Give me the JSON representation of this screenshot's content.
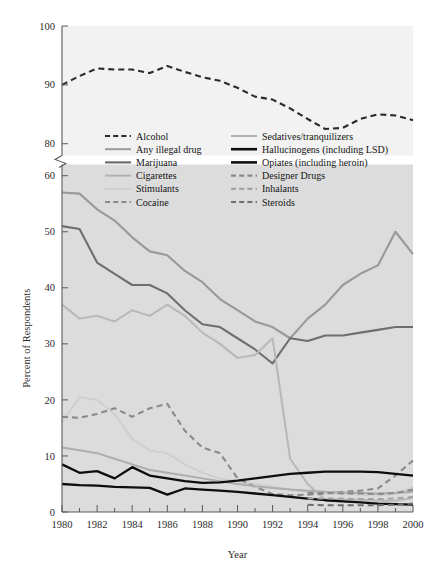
{
  "chart_data": {
    "type": "line",
    "title": "",
    "xlabel": "Year",
    "ylabel": "Percent of Respondents",
    "x": [
      1980,
      1981,
      1982,
      1983,
      1984,
      1985,
      1986,
      1987,
      1988,
      1989,
      1990,
      1991,
      1992,
      1993,
      1994,
      1995,
      1996,
      1997,
      1998,
      1999,
      2000
    ],
    "xlim": [
      1980,
      2000
    ],
    "xticks": [
      "1980",
      "1982",
      "1984",
      "1986",
      "1988",
      "1990",
      "1992",
      "1994",
      "1996",
      "1998",
      "2000"
    ],
    "yticks_lower": [
      "0",
      "10",
      "20",
      "30",
      "40",
      "50",
      "60"
    ],
    "yticks_upper": [
      "80",
      "90",
      "100"
    ],
    "ylim_lower": [
      0,
      62
    ],
    "ylim_upper": [
      78,
      100
    ],
    "axis_break": true,
    "grid": false,
    "legend_position": "inside-top",
    "series": [
      {
        "name": "Alcohol",
        "style": "dashed",
        "color": "#2b2b2b",
        "width": 2.1,
        "values": [
          90,
          91.5,
          92.8,
          92.6,
          92.6,
          92,
          93.2,
          92.2,
          91.3,
          90.7,
          89.5,
          88,
          87.5,
          86,
          84.2,
          82.5,
          82.7,
          84.2,
          85,
          84.8,
          84
        ]
      },
      {
        "name": "Any illegal drug",
        "style": "solid",
        "color": "#999999",
        "width": 2.1,
        "values": [
          57,
          56.8,
          54,
          52,
          49,
          46.5,
          45.8,
          43,
          41,
          38,
          36,
          34,
          33,
          31,
          34.5,
          37,
          40.5,
          42.5,
          44,
          50,
          46
        ]
      },
      {
        "name": "Marijuana",
        "style": "solid",
        "color": "#6e6e6e",
        "width": 2.1,
        "values": [
          51,
          50.5,
          44.5,
          42.5,
          40.5,
          40.5,
          39,
          36,
          33.5,
          33,
          31,
          29,
          26.5,
          31,
          30.5,
          31.5,
          31.5,
          32,
          32.5,
          33,
          33
        ]
      },
      {
        "name": "Cigarettes",
        "style": "solid",
        "color": "#b8b8b8",
        "width": 2.0,
        "values": [
          37,
          34.5,
          35,
          34,
          36,
          35,
          37,
          35,
          32,
          30,
          27.5,
          28,
          31,
          9.5,
          5,
          2.2,
          2.2,
          2.2,
          2,
          2,
          2.5
        ]
      },
      {
        "name": "Stimulants",
        "style": "solid",
        "color": "#cfcfcf",
        "width": 2.0,
        "values": [
          16,
          20.5,
          20,
          17.5,
          13,
          11,
          10.5,
          8.5,
          7,
          6,
          5.5,
          5,
          4.5,
          4,
          3.6,
          3.3,
          3.2,
          3.1,
          3,
          3.2,
          4.5
        ]
      },
      {
        "name": "Cocaine",
        "style": "dashed",
        "color": "#8a8a8a",
        "width": 2.1,
        "values": [
          17,
          16.8,
          17.5,
          18.5,
          17,
          18.5,
          19.3,
          14.5,
          11.5,
          10.5,
          6,
          4.5,
          3.2,
          3,
          3.1,
          3.3,
          3.6,
          3.8,
          4.2,
          6.5,
          9.2
        ]
      },
      {
        "name": "Sedatives/tranquilizers",
        "style": "solid",
        "color": "#adadad",
        "width": 2.0,
        "values": [
          11.5,
          11,
          10.5,
          9.5,
          8.5,
          7.5,
          7,
          6.5,
          6,
          5.5,
          5,
          4.6,
          4.3,
          4,
          3.8,
          3.6,
          3.5,
          3.4,
          3.3,
          3.4,
          3.6
        ]
      },
      {
        "name": "Hallucinogens (including LSD)",
        "style": "solid",
        "color": "#0d0d0d",
        "width": 2.3,
        "values": [
          8.5,
          7,
          7.3,
          6,
          8,
          6.5,
          6,
          5.5,
          5.2,
          5.3,
          5.6,
          6,
          6.4,
          6.8,
          7,
          7.2,
          7.2,
          7.2,
          7.1,
          6.8,
          6.5
        ]
      },
      {
        "name": "Opiates (including heroin)",
        "style": "solid",
        "color": "#0d0d0d",
        "width": 2.3,
        "values": [
          5,
          4.8,
          4.7,
          4.5,
          4.4,
          4.3,
          3.1,
          4.2,
          4,
          3.8,
          3.6,
          3.3,
          3,
          2.7,
          2.4,
          2.1,
          1.9,
          1.7,
          1.5,
          1.4,
          1.3
        ]
      },
      {
        "name": "Designer Drugs",
        "style": "dashed",
        "color": "#8a8a8a",
        "width": 2.0,
        "values": [
          null,
          null,
          null,
          null,
          null,
          null,
          null,
          null,
          null,
          null,
          null,
          null,
          null,
          null,
          3.4,
          3.4,
          3.3,
          3.3,
          3.2,
          3.4,
          4.0
        ]
      },
      {
        "name": "Inhalants",
        "style": "dashed",
        "color": "#a5a5a5",
        "width": 2.0,
        "values": [
          null,
          null,
          null,
          null,
          null,
          null,
          null,
          null,
          null,
          null,
          null,
          null,
          null,
          null,
          2.4,
          2.4,
          2.4,
          2.3,
          2.3,
          2.4,
          2.7
        ]
      },
      {
        "name": "Steroids",
        "style": "dashed",
        "color": "#6e6e6e",
        "width": 2.0,
        "values": [
          null,
          null,
          null,
          null,
          null,
          null,
          null,
          null,
          null,
          null,
          null,
          null,
          null,
          null,
          1.3,
          1.2,
          1.2,
          1.2,
          1.2,
          1.3,
          1.5
        ]
      }
    ]
  },
  "legend": {
    "col1": [
      {
        "label": "Alcohol",
        "style": "dashed",
        "color": "#2b2b2b",
        "width": 2.2
      },
      {
        "label": "Any illegal drug",
        "style": "solid",
        "color": "#999999",
        "width": 2.0
      },
      {
        "label": "Marijuana",
        "style": "solid",
        "color": "#6e6e6e",
        "width": 2.2
      },
      {
        "label": "Cigarettes",
        "style": "solid",
        "color": "#b0b0b0",
        "width": 2.0
      },
      {
        "label": "Stimulants",
        "style": "solid",
        "color": "#cfcfcf",
        "width": 2.0
      },
      {
        "label": "Cocaine",
        "style": "dashed",
        "color": "#8a8a8a",
        "width": 2.2
      }
    ],
    "col2": [
      {
        "label": "Sedatives/tranquilizers",
        "style": "solid",
        "color": "#b0b0b0",
        "width": 2.0
      },
      {
        "label": "Hallucinogens (including LSD)",
        "style": "solid",
        "color": "#0d0d0d",
        "width": 2.6
      },
      {
        "label": "Opiates (including heroin)",
        "style": "solid",
        "color": "#0d0d0d",
        "width": 2.6
      },
      {
        "label": "Designer Drugs",
        "style": "dashed",
        "color": "#8a8a8a",
        "width": 2.2
      },
      {
        "label": "Inhalants",
        "style": "dashed",
        "color": "#a5a5a5",
        "width": 2.2
      },
      {
        "label": "Steroids",
        "style": "dashed",
        "color": "#6e6e6e",
        "width": 2.2
      }
    ]
  }
}
